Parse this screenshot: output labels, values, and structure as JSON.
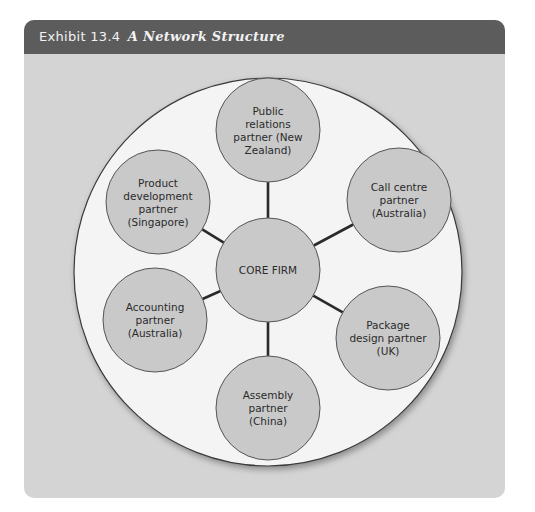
{
  "header": {
    "exhibit": "Exhibit 13.4",
    "title": "A Network Structure"
  },
  "colors": {
    "header_bg": "#5c5c5c",
    "panel_bg": "#d4d4d4",
    "outer_circle": "#f4f4f4",
    "node_fill": "#c9c9c9",
    "connector": "#2a2a2a"
  },
  "diagram": {
    "center": {
      "label": [
        "CORE FIRM"
      ]
    },
    "partners": [
      {
        "id": "public-relations",
        "label": [
          "Public",
          "relations",
          "partner (New",
          "Zealand)"
        ]
      },
      {
        "id": "call-centre",
        "label": [
          "Call centre",
          "partner",
          "(Australia)"
        ]
      },
      {
        "id": "package-design",
        "label": [
          "Package",
          "design partner",
          "(UK)"
        ]
      },
      {
        "id": "assembly",
        "label": [
          "Assembly",
          "partner",
          "(China)"
        ]
      },
      {
        "id": "accounting",
        "label": [
          "Accounting",
          "partner",
          "(Australia)"
        ]
      },
      {
        "id": "product-development",
        "label": [
          "Product",
          "development",
          "partner",
          "(Singapore)"
        ]
      }
    ]
  }
}
